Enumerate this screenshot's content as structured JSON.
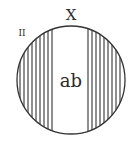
{
  "diagram": {
    "title_label": "X",
    "center_label": "ab",
    "corner_mark": "II",
    "circle": {
      "cx": 71,
      "cy": 80,
      "r": 54
    },
    "hatch": {
      "left_lines_x": [
        20,
        24,
        28,
        32,
        36,
        40,
        44,
        48,
        52
      ],
      "right_lines_x": [
        88,
        92,
        96,
        100,
        104,
        108,
        112,
        116,
        120
      ],
      "stroke_color": "#333333"
    },
    "outline_color": "#333333"
  }
}
